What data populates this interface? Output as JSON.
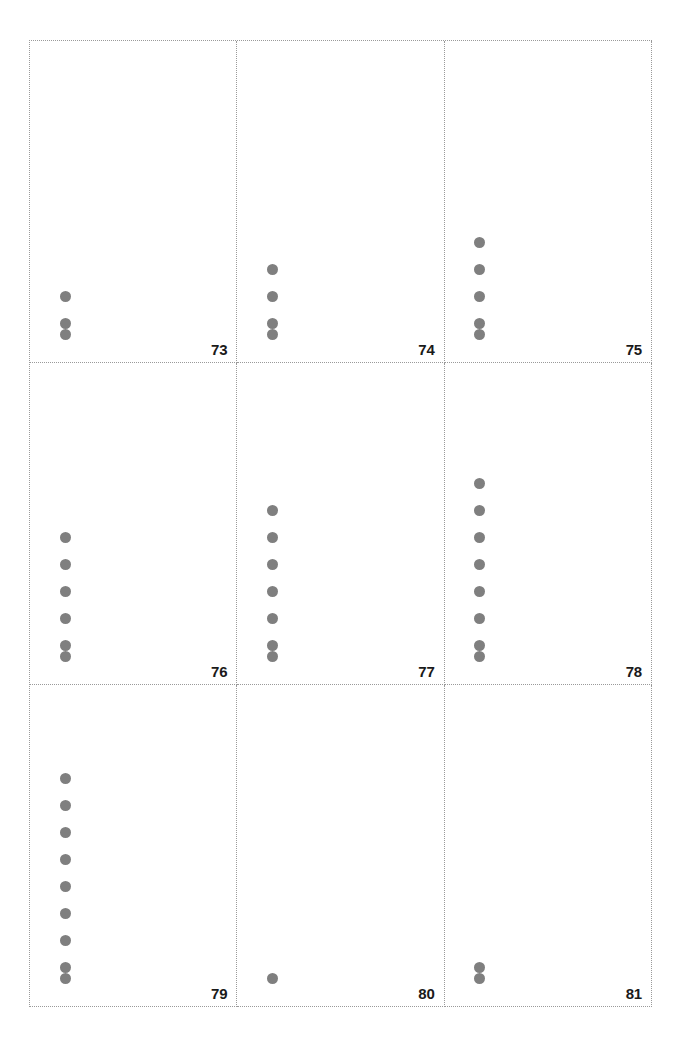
{
  "figure": {
    "title": "",
    "background_color": "#ffffff",
    "panel_border_color": "#9a9a9a",
    "panel_border_style": "dotted",
    "dot_color": "#7f7f7f",
    "label_color": "#1a1a1a"
  },
  "chart_data": {
    "type": "scatter",
    "title": "",
    "subtitle": "",
    "xlabel": "",
    "ylabel": "",
    "grid": false,
    "legend": null,
    "layout": {
      "facet_rows": 3,
      "facet_cols": 3,
      "facet_order": "row-major",
      "panel_border": "dotted",
      "panel_label_position": "bottom-right"
    },
    "axis": {
      "x_ticks": [],
      "y_ticks": [],
      "x_tick_labels": [],
      "y_tick_labels": []
    },
    "facets": [
      {
        "label": "73",
        "count": 3,
        "x": [
          1,
          1,
          1
        ],
        "y": [
          1,
          2,
          3
        ]
      },
      {
        "label": "74",
        "count": 4,
        "x": [
          1,
          1,
          1,
          1
        ],
        "y": [
          1,
          2,
          3,
          4
        ]
      },
      {
        "label": "75",
        "count": 5,
        "x": [
          1,
          1,
          1,
          1,
          1
        ],
        "y": [
          1,
          2,
          3,
          4,
          5
        ]
      },
      {
        "label": "76",
        "count": 6,
        "x": [
          1,
          1,
          1,
          1,
          1,
          1
        ],
        "y": [
          1,
          2,
          3,
          4,
          5,
          6
        ]
      },
      {
        "label": "77",
        "count": 7,
        "x": [
          1,
          1,
          1,
          1,
          1,
          1,
          1
        ],
        "y": [
          1,
          2,
          3,
          4,
          5,
          6,
          7
        ]
      },
      {
        "label": "78",
        "count": 8,
        "x": [
          1,
          1,
          1,
          1,
          1,
          1,
          1,
          1
        ],
        "y": [
          1,
          2,
          3,
          4,
          5,
          6,
          7,
          8
        ]
      },
      {
        "label": "79",
        "count": 9,
        "x": [
          1,
          1,
          1,
          1,
          1,
          1,
          1,
          1,
          1
        ],
        "y": [
          1,
          2,
          3,
          4,
          5,
          6,
          7,
          8,
          9
        ]
      },
      {
        "label": "80",
        "count": 1,
        "x": [
          1
        ],
        "y": [
          1
        ]
      },
      {
        "label": "81",
        "count": 2,
        "x": [
          1,
          1
        ],
        "y": [
          1,
          2
        ]
      }
    ]
  }
}
